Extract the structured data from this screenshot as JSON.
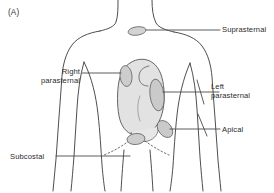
{
  "figure": {
    "panel_label": "(A)",
    "background_color": "#ffffff",
    "outline_color": "#3a3a3a",
    "heart_fill_color": "#e2e2e2",
    "probe_fill_color": "#cfcfcf",
    "leader_line_color": "#4a4a4a",
    "dotted_line_color": "#555555",
    "text_color": "#2b2b2b"
  },
  "labels": {
    "suprasternal": "Suprasternal",
    "right_parasternal_line1": "Right",
    "right_parasternal_line2": "parasternal",
    "left_parasternal_line1": "Left",
    "left_parasternal_line2": "parasternal",
    "apical": "Apical",
    "subcostal": "Subcostal"
  },
  "probe_windows": [
    {
      "name": "suprasternal",
      "label": "Suprasternal",
      "cx": 137,
      "cy": 31
    },
    {
      "name": "right-parasternal",
      "label": "Right parasternal",
      "cx": 126,
      "cy": 76
    },
    {
      "name": "left-parasternal",
      "label": "Left parasternal",
      "cx": 157,
      "cy": 95
    },
    {
      "name": "apical",
      "label": "Apical",
      "cx": 165,
      "cy": 129
    },
    {
      "name": "subcostal",
      "label": "Subcostal",
      "cx": 136,
      "cy": 138
    }
  ]
}
